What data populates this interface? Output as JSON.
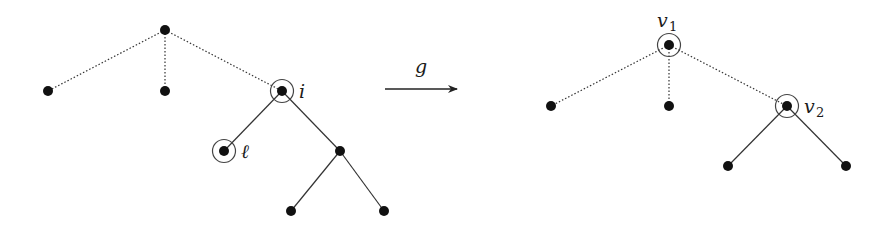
{
  "diagram": {
    "colors": {
      "node": "#111111",
      "edge": "#333333",
      "circle": "#444444",
      "background": "#ffffff"
    },
    "left_tree": {
      "nodes": [
        {
          "id": "root",
          "x": 165,
          "y": 30,
          "circled": false,
          "label": ""
        },
        {
          "id": "a",
          "x": 48,
          "y": 91,
          "circled": false,
          "label": ""
        },
        {
          "id": "b",
          "x": 165,
          "y": 91,
          "circled": false,
          "label": ""
        },
        {
          "id": "i",
          "x": 282,
          "y": 91,
          "circled": true,
          "label": "i"
        },
        {
          "id": "l",
          "x": 224,
          "y": 151,
          "circled": true,
          "label": "ℓ"
        },
        {
          "id": "c",
          "x": 340,
          "y": 151,
          "circled": false,
          "label": ""
        },
        {
          "id": "d",
          "x": 291,
          "y": 211,
          "circled": false,
          "label": ""
        },
        {
          "id": "e",
          "x": 384,
          "y": 211,
          "circled": false,
          "label": ""
        }
      ],
      "edges": [
        {
          "from": "root",
          "to": "a",
          "style": "dotted"
        },
        {
          "from": "root",
          "to": "b",
          "style": "dotted"
        },
        {
          "from": "root",
          "to": "i",
          "style": "dotted"
        },
        {
          "from": "i",
          "to": "l",
          "style": "solid"
        },
        {
          "from": "i",
          "to": "c",
          "style": "solid"
        },
        {
          "from": "c",
          "to": "d",
          "style": "solid"
        },
        {
          "from": "c",
          "to": "e",
          "style": "solid"
        }
      ]
    },
    "arrow": {
      "label": "g",
      "x1": 385,
      "y1": 89,
      "x2": 458,
      "y2": 89
    },
    "right_tree": {
      "nodes": [
        {
          "id": "v1",
          "x": 669,
          "y": 45,
          "circled": true,
          "label": "v",
          "subscript": "1"
        },
        {
          "id": "p",
          "x": 551,
          "y": 106,
          "circled": false,
          "label": ""
        },
        {
          "id": "q",
          "x": 669,
          "y": 106,
          "circled": false,
          "label": ""
        },
        {
          "id": "v2",
          "x": 787,
          "y": 106,
          "circled": true,
          "label": "v",
          "subscript": "2"
        },
        {
          "id": "r",
          "x": 728,
          "y": 166,
          "circled": false,
          "label": ""
        },
        {
          "id": "s",
          "x": 846,
          "y": 166,
          "circled": false,
          "label": ""
        }
      ],
      "edges": [
        {
          "from": "v1",
          "to": "p",
          "style": "dotted"
        },
        {
          "from": "v1",
          "to": "q",
          "style": "dotted"
        },
        {
          "from": "v1",
          "to": "v2",
          "style": "dotted"
        },
        {
          "from": "v2",
          "to": "r",
          "style": "solid"
        },
        {
          "from": "v2",
          "to": "s",
          "style": "solid"
        }
      ]
    },
    "labels": {
      "i": "i",
      "l": "ℓ",
      "g": "g",
      "v1_main": "v",
      "v1_sub": "1",
      "v2_main": "v",
      "v2_sub": "2"
    }
  }
}
